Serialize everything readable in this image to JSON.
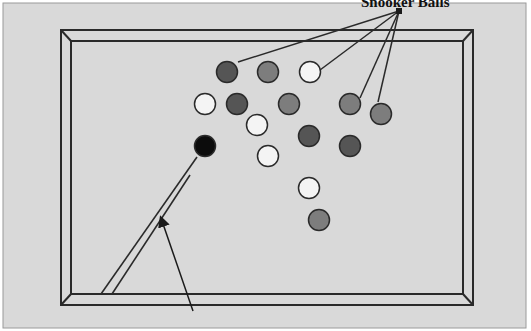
{
  "diagram": {
    "title_label": "Snooker Balls",
    "colors": {
      "background": "#d9d9d9",
      "border": "#9a9a9a",
      "line": "#2a2a2a",
      "ball_dark": "#555555",
      "ball_medium": "#7d7d7d",
      "ball_white": "#f4f4f4",
      "ball_black": "#0c0c0c"
    },
    "label_anchor": [
      400,
      10
    ],
    "balls": [
      {
        "x": 227,
        "y": 72,
        "shade": "dark"
      },
      {
        "x": 268,
        "y": 72,
        "shade": "medium"
      },
      {
        "x": 310,
        "y": 72,
        "shade": "white"
      },
      {
        "x": 205,
        "y": 104,
        "shade": "white"
      },
      {
        "x": 237,
        "y": 104,
        "shade": "dark"
      },
      {
        "x": 289,
        "y": 104,
        "shade": "medium"
      },
      {
        "x": 350,
        "y": 104,
        "shade": "medium"
      },
      {
        "x": 381,
        "y": 114,
        "shade": "medium"
      },
      {
        "x": 257,
        "y": 125,
        "shade": "white"
      },
      {
        "x": 309,
        "y": 136,
        "shade": "dark"
      },
      {
        "x": 205,
        "y": 146,
        "shade": "black"
      },
      {
        "x": 268,
        "y": 156,
        "shade": "white"
      },
      {
        "x": 350,
        "y": 146,
        "shade": "dark"
      },
      {
        "x": 309,
        "y": 188,
        "shade": "white"
      },
      {
        "x": 319,
        "y": 220,
        "shade": "medium"
      }
    ],
    "pointer_lines_to": [
      [
        238,
        62
      ],
      [
        320,
        70
      ],
      [
        360,
        98
      ],
      [
        378,
        102
      ]
    ],
    "cue_arrow": {
      "from": [
        193,
        311
      ],
      "to": [
        161,
        218
      ]
    }
  }
}
